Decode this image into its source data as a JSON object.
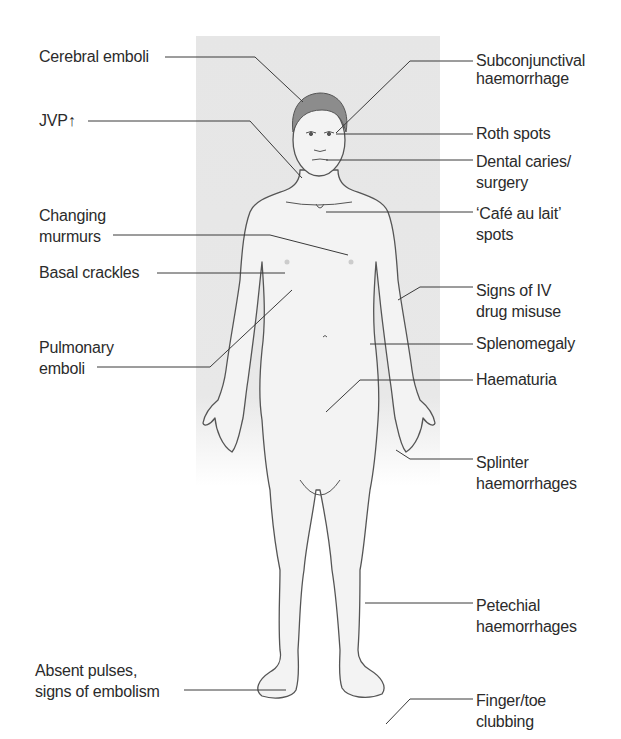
{
  "figure": {
    "panel_color": "#e6e6e6",
    "line_color": "#3a3a3a",
    "skin_color": "#f2f2f2",
    "hair_color": "#8a8a8a"
  },
  "labels_left": [
    {
      "id": "cerebral-emboli",
      "lines": [
        "Cerebral emboli"
      ]
    },
    {
      "id": "jvp",
      "lines": [
        "JVP↑"
      ]
    },
    {
      "id": "changing-murmurs",
      "lines": [
        "Changing",
        "murmurs"
      ]
    },
    {
      "id": "basal-crackles",
      "lines": [
        "Basal crackles"
      ]
    },
    {
      "id": "pulmonary-emboli",
      "lines": [
        "Pulmonary",
        "emboli"
      ]
    },
    {
      "id": "absent-pulses",
      "lines": [
        "Absent pulses,",
        "signs of embolism"
      ]
    }
  ],
  "labels_right": [
    {
      "id": "subconjunctival-haemorrhage",
      "lines": [
        "Subconjunctival",
        "haemorrhage"
      ]
    },
    {
      "id": "roth-spots",
      "lines": [
        "Roth spots"
      ]
    },
    {
      "id": "dental-caries",
      "lines": [
        "Dental caries/",
        "surgery"
      ]
    },
    {
      "id": "cafe-au-lait",
      "lines": [
        "‘Café au lait’",
        "spots"
      ]
    },
    {
      "id": "iv-drug-misuse",
      "lines": [
        "Signs of IV",
        "drug misuse"
      ]
    },
    {
      "id": "splenomegaly",
      "lines": [
        "Splenomegaly"
      ]
    },
    {
      "id": "haematuria",
      "lines": [
        "Haematuria"
      ]
    },
    {
      "id": "splinter-haemorrhages",
      "lines": [
        "Splinter",
        "haemorrhages"
      ]
    },
    {
      "id": "petechial-haemorrhages",
      "lines": [
        "Petechial",
        "haemorrhages"
      ]
    },
    {
      "id": "clubbing",
      "lines": [
        "Finger/toe",
        "clubbing"
      ]
    }
  ]
}
